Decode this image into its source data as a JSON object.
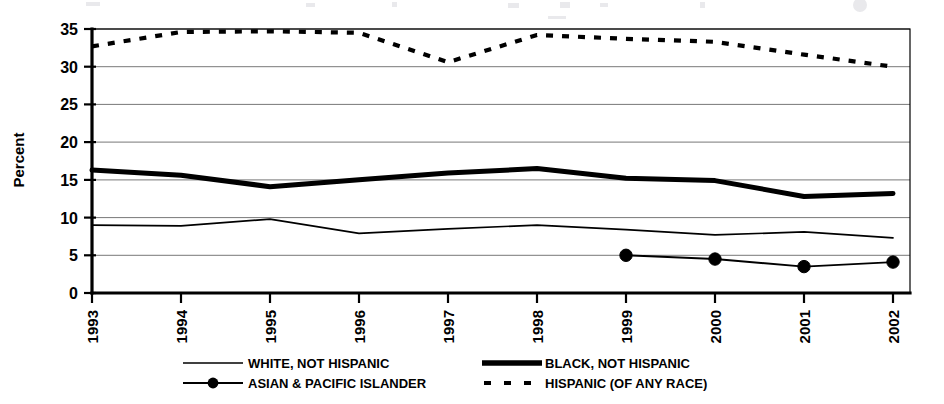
{
  "chart_data": {
    "type": "line",
    "title": "",
    "subtitle": "",
    "xlabel": "",
    "ylabel": "Percent",
    "categories": [
      "1993",
      "1994",
      "1995",
      "1996",
      "1997",
      "1998",
      "1999",
      "2000",
      "2001",
      "2002"
    ],
    "x": [
      1993,
      1994,
      1995,
      1996,
      1997,
      1998,
      1999,
      2000,
      2001,
      2002
    ],
    "xlim": [
      1993,
      2002
    ],
    "ylim": [
      0,
      35
    ],
    "yticks": [
      0,
      5,
      10,
      15,
      20,
      25,
      30,
      35
    ],
    "ytick_labels": [
      "0",
      "5",
      "10",
      "15",
      "20",
      "25",
      "30",
      "35"
    ],
    "grid": true,
    "grid_axis": "y",
    "legend_position": "bottom",
    "series": [
      {
        "name": "WHITE, NOT HISPANIC",
        "style": "thin-solid",
        "color": "#000000",
        "values": [
          9.0,
          8.9,
          9.8,
          7.9,
          8.5,
          9.0,
          8.4,
          7.7,
          8.1,
          7.3
        ]
      },
      {
        "name": "BLACK, NOT HISPANIC",
        "style": "thick-solid",
        "color": "#000000",
        "values": [
          16.3,
          15.6,
          14.1,
          15.0,
          15.9,
          16.5,
          15.2,
          14.9,
          12.8,
          13.2
        ]
      },
      {
        "name": "ASIAN & PACIFIC ISLANDER",
        "style": "solid-with-markers",
        "color": "#000000",
        "values": [
          null,
          null,
          null,
          null,
          null,
          null,
          5.0,
          4.5,
          3.5,
          4.1
        ]
      },
      {
        "name": "HISPANIC (OF ANY RACE)",
        "style": "dashed",
        "color": "#000000",
        "values": [
          32.7,
          34.6,
          34.7,
          34.5,
          30.6,
          34.2,
          33.7,
          33.3,
          31.6,
          30.0
        ]
      }
    ]
  },
  "axis": {
    "y_title": "Percent"
  },
  "legend": {
    "entries": [
      {
        "label": "WHITE, NOT HISPANIC",
        "marker": "thin-line-icon"
      },
      {
        "label": "BLACK, NOT HISPANIC",
        "marker": "thick-line-icon"
      },
      {
        "label": "ASIAN & PACIFIC ISLANDER",
        "marker": "line-with-dot-icon"
      },
      {
        "label": "HISPANIC (OF ANY RACE)",
        "marker": "dashed-line-icon"
      }
    ]
  }
}
